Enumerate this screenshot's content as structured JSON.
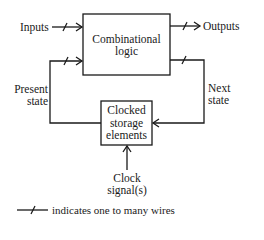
{
  "diagram": {
    "blocks": {
      "combinational": {
        "line1": "Combinational",
        "line2": "logic"
      },
      "storage": {
        "line1": "Clocked",
        "line2": "storage",
        "line3": "elements"
      }
    },
    "signals": {
      "inputs": "Inputs",
      "outputs": "Outputs",
      "present_state": {
        "line1": "Present",
        "line2": "state"
      },
      "next_state": {
        "line1": "Next",
        "line2": "state"
      },
      "clock": {
        "line1": "Clock",
        "line2": "signal(s)"
      }
    },
    "legend": {
      "text": "indicates one to many wires"
    },
    "colors": {
      "line": "#1a1a1a",
      "background": "#ffffff"
    }
  }
}
